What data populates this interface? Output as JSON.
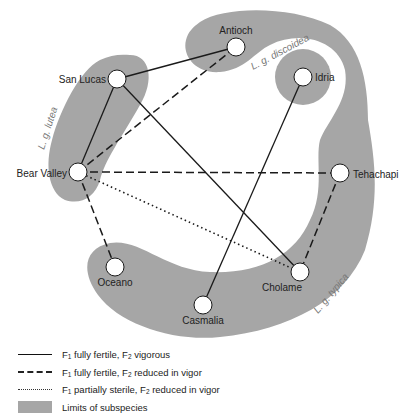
{
  "colors": {
    "region_fill": "#a6a6a6",
    "node_fill": "#ffffff",
    "line": "#1a1a1a",
    "background": "#ffffff"
  },
  "nodes": [
    {
      "id": "antioch",
      "label": "Antioch",
      "x": 236,
      "y": 47
    },
    {
      "id": "san-lucas",
      "label": "San Lucas",
      "x": 117,
      "y": 79
    },
    {
      "id": "idria",
      "label": "Idria",
      "x": 303,
      "y": 77
    },
    {
      "id": "bear-valley",
      "label": "Bear Valley",
      "x": 78,
      "y": 172
    },
    {
      "id": "tehachapi",
      "label": "Tehachapi",
      "x": 340,
      "y": 173
    },
    {
      "id": "oceano",
      "label": "Oceano",
      "x": 115,
      "y": 267
    },
    {
      "id": "cholame",
      "label": "Cholame",
      "x": 300,
      "y": 272
    },
    {
      "id": "casmalia",
      "label": "Casmalia",
      "x": 203,
      "y": 305
    }
  ],
  "edges": [
    {
      "from": "san-lucas",
      "to": "antioch",
      "type": "solid"
    },
    {
      "from": "san-lucas",
      "to": "bear-valley",
      "type": "solid"
    },
    {
      "from": "san-lucas",
      "to": "cholame",
      "type": "solid"
    },
    {
      "from": "idria",
      "to": "casmalia",
      "type": "solid"
    },
    {
      "from": "bear-valley",
      "to": "antioch",
      "type": "dashed"
    },
    {
      "from": "bear-valley",
      "to": "tehachapi",
      "type": "dashed"
    },
    {
      "from": "bear-valley",
      "to": "oceano",
      "type": "dashed"
    },
    {
      "from": "tehachapi",
      "to": "cholame",
      "type": "dashed"
    },
    {
      "from": "bear-valley",
      "to": "cholame",
      "type": "dotted"
    }
  ],
  "regions": [
    {
      "id": "lutea",
      "label": "L. g. lutea"
    },
    {
      "id": "discoidea",
      "label": "L. g. discoidea"
    },
    {
      "id": "typica",
      "label": "L. g. typica"
    }
  ],
  "legend": [
    {
      "type": "solid",
      "f1": "F",
      "f1_sub": "1",
      "text_a": " fully fertile, F",
      "f2_sub": "2",
      "text_b": " vigorous"
    },
    {
      "type": "dashed",
      "f1": "F",
      "f1_sub": "1",
      "text_a": " fully fertile, F",
      "f2_sub": "2",
      "text_b": " reduced in vigor"
    },
    {
      "type": "dotted",
      "f1": "F",
      "f1_sub": "1",
      "text_a": " partially sterile, F",
      "f2_sub": "2",
      "text_b": " reduced in vigor"
    },
    {
      "type": "fill",
      "text": "Limits of subspecies"
    }
  ]
}
